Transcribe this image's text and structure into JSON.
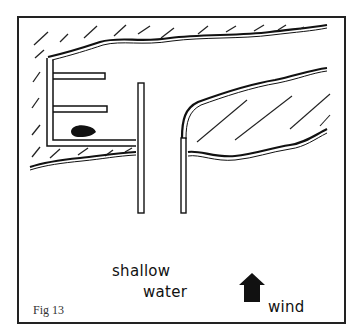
{
  "figure": {
    "caption": "Fig 13",
    "labels": {
      "shallow": "shallow",
      "water": "water",
      "wind": "wind"
    },
    "elements": {
      "frame": "rectangular border",
      "shore_hatched": "hatched land area top-left with shoreline",
      "harbor_structure": "E-shaped dock structure with two finger piers",
      "boat": "filled dark boat shape moored inside harbor",
      "pier_left": "long vertical pier",
      "pier_right": "shorter vertical pier attached to right shoreline",
      "land_right": "hatched land strip on right between two shorelines",
      "wind_arrow": "solid upward arrow indicating wind direction"
    },
    "colors": {
      "ink": "#111111",
      "paper": "#ffffff"
    }
  }
}
